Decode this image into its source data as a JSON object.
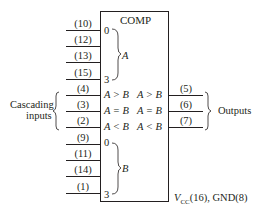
{
  "chip": {
    "title": "COMP",
    "power": {
      "v": "V",
      "sub": "CC",
      "rest": "(16), GND(8)"
    }
  },
  "a_inputs": [
    {
      "pin": "(10)",
      "bit": "0"
    },
    {
      "pin": "(12)",
      "bit": ""
    },
    {
      "pin": "(13)",
      "bit": ""
    },
    {
      "pin": "(15)",
      "bit": "3"
    }
  ],
  "a_group_label": "A",
  "cascading": {
    "label_line1": "Cascading",
    "label_line2": "inputs",
    "pins": [
      {
        "pin": "(4)",
        "name": "A > B"
      },
      {
        "pin": "(3)",
        "name": "A = B"
      },
      {
        "pin": "(2)",
        "name": "A < B"
      }
    ]
  },
  "b_inputs": [
    {
      "pin": "(9)",
      "bit": "0"
    },
    {
      "pin": "(11)",
      "bit": ""
    },
    {
      "pin": "(14)",
      "bit": ""
    },
    {
      "pin": "(1)",
      "bit": "3"
    }
  ],
  "b_group_label": "B",
  "outputs": {
    "label": "Outputs",
    "pins": [
      {
        "pin": "(5)",
        "name": "A > B"
      },
      {
        "pin": "(6)",
        "name": "A = B"
      },
      {
        "pin": "(7)",
        "name": "A < B"
      }
    ]
  }
}
